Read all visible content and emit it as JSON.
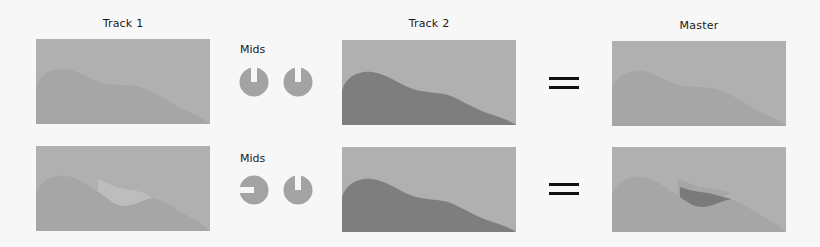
{
  "colors": {
    "background": "#f7f7f7",
    "panel": "#b0b0b0",
    "waveform_light": "#a6a6a6",
    "waveform_dark": "#7e7e7e",
    "mid_boost": "#bdbdbd",
    "mid_cut": "#7a7a7a",
    "knob": "#a3a3a3",
    "equals": "#111111"
  },
  "columns": {
    "track1": {
      "title": "Track 1"
    },
    "track2": {
      "title": "Track 2"
    },
    "master": {
      "title": "Master"
    }
  },
  "rows": [
    {
      "eq_label": "Mids",
      "knobs": [
        {
          "name": "track1-mids",
          "notch_direction": "up"
        },
        {
          "name": "track2-mids",
          "notch_direction": "up"
        }
      ],
      "operator": "="
    },
    {
      "eq_label": "Mids",
      "knobs": [
        {
          "name": "track1-mids",
          "notch_direction": "left"
        },
        {
          "name": "track2-mids",
          "notch_direction": "up"
        }
      ],
      "operator": "="
    }
  ]
}
